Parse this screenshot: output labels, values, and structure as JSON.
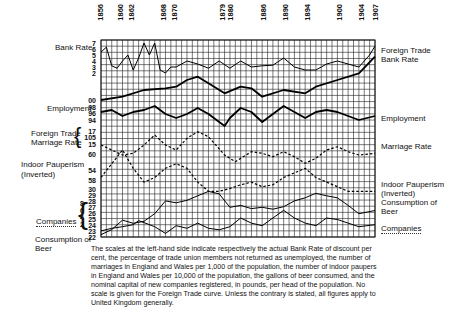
{
  "chart_data": {
    "type": "line",
    "title": "",
    "xlabel": "",
    "ylabel": "",
    "x_tick_labels": [
      "1856",
      "1860",
      "1862",
      "1868",
      "1870",
      "1879",
      "1880",
      "1886",
      "1890",
      "1894",
      "1900",
      "1904",
      "1907"
    ],
    "x_range": [
      1856,
      1907
    ],
    "grid": true,
    "legend_position": "side labels (left and right)",
    "left_scales": {
      "Bank Rate": [
        "7",
        "6",
        "5",
        "4",
        "3",
        "2"
      ],
      "Employment": [
        "00",
        "98",
        "96",
        "94"
      ],
      "Foreign Trade / Marriage Rate": [
        "17",
        "105",
        "15"
      ],
      "Indoor Pauperism (Inverted)": [
        "60",
        "54",
        "58"
      ],
      "Consumption of Beer": [
        "30",
        "29",
        "28",
        "27",
        "26",
        "25",
        "24",
        "23",
        "22"
      ],
      "Companies": [
        "8",
        "6",
        "4",
        "2"
      ]
    },
    "series": [
      {
        "name": "Bank Rate",
        "style": "thin solid",
        "x": [
          1856,
          1857,
          1858,
          1859,
          1860,
          1861,
          1862,
          1863,
          1864,
          1865,
          1866,
          1867,
          1868,
          1869,
          1870,
          1872,
          1874,
          1876,
          1878,
          1880,
          1882,
          1884,
          1886,
          1888,
          1890,
          1892,
          1894,
          1896,
          1898,
          1900,
          1902,
          1904,
          1906,
          1907
        ],
        "values": [
          5.5,
          6.3,
          3.2,
          2.8,
          4.0,
          5.0,
          2.5,
          4.5,
          7.0,
          5.0,
          7.0,
          2.5,
          2.0,
          3.0,
          3.0,
          4.0,
          3.5,
          2.8,
          4.0,
          2.8,
          4.0,
          3.0,
          3.2,
          3.3,
          4.5,
          3.0,
          2.5,
          2.5,
          3.5,
          4.0,
          3.5,
          3.0,
          5.0,
          6.5
        ]
      },
      {
        "name": "Foreign Trade",
        "style": "thick solid",
        "x": [
          1856,
          1860,
          1864,
          1868,
          1870,
          1872,
          1874,
          1876,
          1879,
          1882,
          1884,
          1886,
          1890,
          1894,
          1896,
          1900,
          1904,
          1907
        ],
        "values": [
          95,
          96,
          98,
          98.5,
          99,
          101,
          102,
          100,
          97,
          99,
          98.5,
          96,
          98,
          97,
          99,
          101,
          103,
          108
        ]
      },
      {
        "name": "Employment",
        "style": "thick solid",
        "x": [
          1856,
          1858,
          1860,
          1862,
          1864,
          1866,
          1868,
          1870,
          1872,
          1874,
          1876,
          1878,
          1879,
          1880,
          1882,
          1884,
          1886,
          1888,
          1890,
          1892,
          1894,
          1896,
          1898,
          1900,
          1902,
          1904,
          1907
        ],
        "values": [
          96.5,
          97,
          95.5,
          96.5,
          97,
          98,
          96,
          95,
          96,
          97.5,
          96,
          94,
          93,
          95,
          97.5,
          96.5,
          94,
          96,
          98,
          96.5,
          95,
          96.5,
          97,
          96.5,
          95.5,
          94.5,
          95.5
        ]
      },
      {
        "name": "Marriage Rate",
        "style": "dashed",
        "x": [
          1856,
          1858,
          1860,
          1862,
          1864,
          1866,
          1868,
          1870,
          1872,
          1874,
          1876,
          1879,
          1881,
          1884,
          1886,
          1888,
          1890,
          1892,
          1894,
          1896,
          1898,
          1900,
          1902,
          1904,
          1907
        ],
        "values": [
          16.8,
          16.5,
          16.2,
          16.3,
          16.8,
          17.4,
          16.8,
          16.5,
          17.2,
          17.6,
          17.3,
          16.2,
          15.8,
          16.4,
          16.3,
          16.1,
          16.4,
          16.1,
          15.7,
          16.0,
          16.5,
          16.7,
          16.4,
          16.2,
          16.3
        ]
      },
      {
        "name": "Indoor Pauperism (Inverted)",
        "style": "dashed",
        "x": [
          1856,
          1858,
          1860,
          1862,
          1864,
          1866,
          1868,
          1870,
          1872,
          1874,
          1876,
          1878,
          1880,
          1882,
          1884,
          1886,
          1888,
          1890,
          1892,
          1894,
          1896,
          1898,
          1900,
          1902,
          1904,
          1907
        ],
        "values": [
          57,
          58.5,
          60,
          58,
          56.5,
          57,
          58,
          58.5,
          58,
          56.5,
          55.5,
          55.5,
          55.8,
          56.2,
          56.5,
          56,
          56.2,
          57,
          57.5,
          58,
          57,
          56.5,
          56,
          55.5,
          55.5,
          55.5
        ]
      },
      {
        "name": "Consumption of Beer",
        "style": "thin solid",
        "x": [
          1856,
          1858,
          1860,
          1862,
          1864,
          1866,
          1868,
          1870,
          1872,
          1874,
          1876,
          1878,
          1880,
          1882,
          1884,
          1886,
          1888,
          1890,
          1892,
          1894,
          1896,
          1898,
          1900,
          1902,
          1904,
          1907
        ],
        "values": [
          22.2,
          23,
          24.5,
          24,
          24.3,
          25.5,
          27.5,
          27.2,
          27.6,
          28.3,
          29,
          28.6,
          26.5,
          26.8,
          26.3,
          26.5,
          26.2,
          26.6,
          27.5,
          28,
          28.7,
          28.3,
          28,
          26.8,
          25.5,
          26
        ]
      },
      {
        "name": "Companies",
        "style": "thin solid",
        "x": [
          1856,
          1858,
          1860,
          1862,
          1863,
          1864,
          1866,
          1868,
          1870,
          1872,
          1874,
          1876,
          1878,
          1880,
          1882,
          1884,
          1886,
          1888,
          1890,
          1892,
          1894,
          1896,
          1898,
          1900,
          1902,
          1904,
          1907
        ],
        "values": [
          2,
          2.5,
          2.8,
          3.2,
          4,
          3.6,
          2.8,
          1.5,
          3,
          2.5,
          3.5,
          2.5,
          2.2,
          2.8,
          4.5,
          3.5,
          3,
          4.5,
          6,
          4.5,
          3.5,
          3,
          4.5,
          4.2,
          3.5,
          2.8,
          3.2
        ]
      }
    ]
  },
  "labels": {
    "left": {
      "bank_rate": "Bank Rate",
      "employment": "Employment",
      "foreign_trade": "Foreign Trade",
      "marriage_rate": "Marriage Rate",
      "indoor_pauperism": "Indoor Pauperism",
      "inverted": "(Inverted)",
      "companies": "Companies",
      "consumption_of": "Consumption of",
      "beer": "Beer"
    },
    "right": {
      "foreign_trade": "Foreign Trade",
      "bank_rate": "Bank Rate",
      "employment": "Employment",
      "marriage_rate": "Marriage Rate",
      "indoor_pauperism": "Indoor Pauperism",
      "inverted": "(Inverted)",
      "consumption_of": "Consumption of",
      "beer": "Beer",
      "companies": "Companies"
    }
  },
  "ticks": {
    "bank_rate": [
      "7",
      "6",
      "5",
      "4",
      "3",
      "2"
    ],
    "employment": [
      "00",
      "98",
      "96",
      "94"
    ],
    "ft_mr": [
      "17",
      "105",
      "15"
    ],
    "pauperism": [
      "60",
      "54",
      "58"
    ],
    "beer": [
      "30",
      "29",
      "28",
      "27",
      "26",
      "25",
      "24",
      "23",
      "22"
    ],
    "companies": [
      "8",
      "6",
      "4",
      "2"
    ]
  },
  "caption": "The scales at the left-hand side indicate respectively the actual Bank Rate of discount per cent, the percentage of trade union members not returned as unemployed, the number of marriages in England and Wales per 1,000 of the population, the number of indoor paupers in England and Wales per 10,000 of the population, the gallons of beer consumed, and the nominal capital of new companies registered, in pounds, per head of the population. No scale is given for the Foreign Trade curve. Unless the contrary is stated, all figures apply to United Kingdom generally."
}
